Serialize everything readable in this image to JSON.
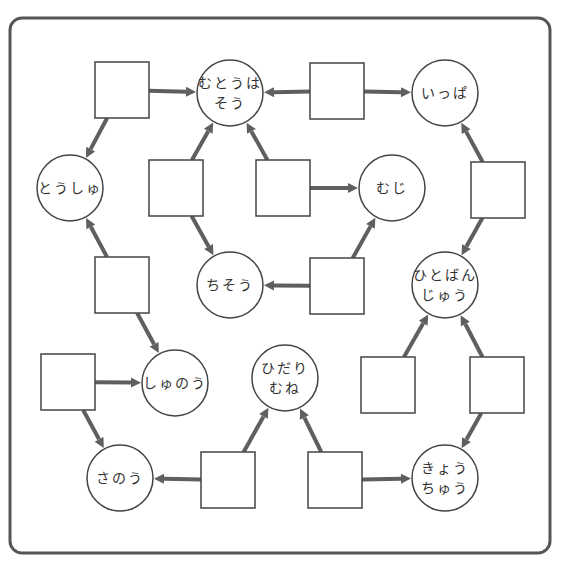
{
  "colors": {
    "frame": "#555555",
    "arrow": "#5f5f5f",
    "node_stroke": "#444444",
    "text": "#333333",
    "background": "#ffffff"
  },
  "circles": [
    {
      "id": "mutouhasou",
      "lines": [
        "むとうは",
        "そう"
      ],
      "cx": 230,
      "cy": 93
    },
    {
      "id": "ippa",
      "lines": [
        "いっぱ"
      ],
      "cx": 445,
      "cy": 93
    },
    {
      "id": "toushu",
      "lines": [
        "とうしゅ"
      ],
      "cx": 70,
      "cy": 188
    },
    {
      "id": "muji",
      "lines": [
        "むじ"
      ],
      "cx": 392,
      "cy": 188
    },
    {
      "id": "chisou",
      "lines": [
        "ちそう"
      ],
      "cx": 230,
      "cy": 285
    },
    {
      "id": "hitobanjuu",
      "lines": [
        "ひとばん",
        "じゅう"
      ],
      "cx": 445,
      "cy": 285
    },
    {
      "id": "shunou",
      "lines": [
        "しゅのう"
      ],
      "cx": 175,
      "cy": 383
    },
    {
      "id": "hidarimune",
      "lines": [
        "ひだり",
        "むね"
      ],
      "cx": 285,
      "cy": 378
    },
    {
      "id": "sanou",
      "lines": [
        "さのう"
      ],
      "cx": 120,
      "cy": 478
    },
    {
      "id": "kyouchuu",
      "lines": [
        "きょう",
        "ちゅう"
      ],
      "cx": 445,
      "cy": 478
    }
  ],
  "circle_radius": 33,
  "squares": [
    {
      "id": "sq1",
      "cx": 122,
      "cy": 90
    },
    {
      "id": "sq2",
      "cx": 337,
      "cy": 91
    },
    {
      "id": "sq3",
      "cx": 176,
      "cy": 188
    },
    {
      "id": "sq4",
      "cx": 283,
      "cy": 188
    },
    {
      "id": "sq5",
      "cx": 498,
      "cy": 190
    },
    {
      "id": "sq6",
      "cx": 122,
      "cy": 285
    },
    {
      "id": "sq7",
      "cx": 337,
      "cy": 286
    },
    {
      "id": "sq8",
      "cx": 68,
      "cy": 382
    },
    {
      "id": "sq9",
      "cx": 388,
      "cy": 385
    },
    {
      "id": "sq10",
      "cx": 497,
      "cy": 385
    },
    {
      "id": "sq11",
      "cx": 228,
      "cy": 480
    },
    {
      "id": "sq12",
      "cx": 335,
      "cy": 480
    }
  ],
  "square_size": {
    "w": 54,
    "h": 56
  },
  "arrows": [
    {
      "from": "sq1",
      "to": "mutouhasou"
    },
    {
      "from": "sq1",
      "to": "toushu"
    },
    {
      "from": "sq2",
      "to": "mutouhasou"
    },
    {
      "from": "sq2",
      "to": "ippa"
    },
    {
      "from": "sq3",
      "to": "mutouhasou"
    },
    {
      "from": "sq3",
      "to": "chisou"
    },
    {
      "from": "sq4",
      "to": "mutouhasou"
    },
    {
      "from": "sq4",
      "to": "muji"
    },
    {
      "from": "sq5",
      "to": "ippa"
    },
    {
      "from": "sq5",
      "to": "hitobanjuu"
    },
    {
      "from": "sq6",
      "to": "toushu"
    },
    {
      "from": "sq6",
      "to": "shunou"
    },
    {
      "from": "sq7",
      "to": "chisou"
    },
    {
      "from": "sq7",
      "to": "muji"
    },
    {
      "from": "sq8",
      "to": "shunou"
    },
    {
      "from": "sq8",
      "to": "sanou"
    },
    {
      "from": "sq9",
      "to": "hitobanjuu"
    },
    {
      "from": "sq10",
      "to": "hitobanjuu"
    },
    {
      "from": "sq10",
      "to": "kyouchuu"
    },
    {
      "from": "sq11",
      "to": "sanou"
    },
    {
      "from": "sq11",
      "to": "hidarimune"
    },
    {
      "from": "sq12",
      "to": "hidarimune"
    },
    {
      "from": "sq12",
      "to": "kyouchuu"
    }
  ]
}
